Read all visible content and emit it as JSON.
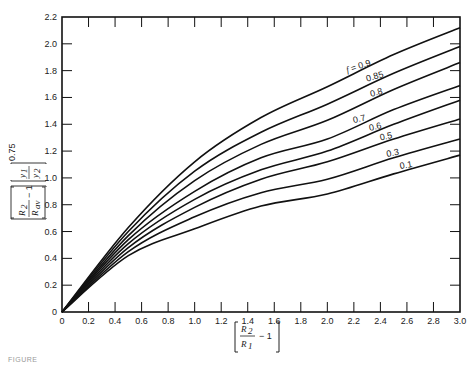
{
  "chart_data": {
    "type": "line",
    "title": "",
    "xlabel": "[R2/R1 - 1]",
    "ylabel": "[R2/Rav - 1][y1/y2]^0.75",
    "xlim": [
      0,
      3.0
    ],
    "ylim": [
      0,
      2.2
    ],
    "x_ticks": [
      "0",
      "0.2",
      "0.4",
      "0.6",
      "0.8",
      "1.0",
      "1.2",
      "1.4",
      "1.6",
      "1.8",
      "2.0",
      "2.2",
      "2.4",
      "2.6",
      "2.8",
      "3.0"
    ],
    "y_ticks": [
      "0",
      "0.2",
      "0.4",
      "0.6",
      "0.8",
      "1.0",
      "1.2",
      "1.4",
      "1.6",
      "1.8",
      "2.0",
      "2.2"
    ],
    "grid": false,
    "legend": "inline curve labels near right end",
    "x": [
      0,
      0.5,
      1.0,
      1.5,
      2.0,
      2.5,
      3.0
    ],
    "series": [
      {
        "name": "f = 0.9",
        "label": "f = 0.9",
        "values": [
          0,
          0.63,
          1.12,
          1.45,
          1.68,
          1.92,
          2.12
        ]
      },
      {
        "name": "f = 0.85",
        "label": "0.85",
        "values": [
          0,
          0.6,
          1.05,
          1.34,
          1.55,
          1.78,
          1.98
        ]
      },
      {
        "name": "f = 0.8",
        "label": "0.8",
        "values": [
          0,
          0.57,
          0.98,
          1.25,
          1.43,
          1.66,
          1.86
        ]
      },
      {
        "name": "f = 0.7",
        "label": "0.7",
        "values": [
          0,
          0.54,
          0.9,
          1.15,
          1.29,
          1.51,
          1.69
        ]
      },
      {
        "name": "f = 0.6",
        "label": "0.6",
        "values": [
          0,
          0.51,
          0.84,
          1.06,
          1.2,
          1.4,
          1.58
        ]
      },
      {
        "name": "f = 0.5",
        "label": "0.5",
        "values": [
          0,
          0.48,
          0.78,
          0.99,
          1.12,
          1.29,
          1.44
        ]
      },
      {
        "name": "f = 0.3",
        "label": "0.3",
        "values": [
          0,
          0.45,
          0.71,
          0.89,
          0.99,
          1.15,
          1.29
        ]
      },
      {
        "name": "f = 0.1",
        "label": "0.1",
        "values": [
          0,
          0.42,
          0.62,
          0.79,
          0.88,
          1.03,
          1.17
        ]
      }
    ]
  },
  "axes": {
    "x_label_num": "R",
    "x_label_num_sub": "2",
    "x_label_den": "R",
    "x_label_den_sub": "1",
    "x_label_tail": "− 1",
    "y_label_a_num": "R",
    "y_label_a_num_sub": "2",
    "y_label_a_den": "R",
    "y_label_a_den_sub": "av",
    "y_label_a_tail": "− 1",
    "y_label_b_num": "y",
    "y_label_b_num_sub": "1",
    "y_label_b_den": "y",
    "y_label_b_den_sub": "2",
    "y_label_exp": "0.75"
  },
  "caption": "FIGURE"
}
